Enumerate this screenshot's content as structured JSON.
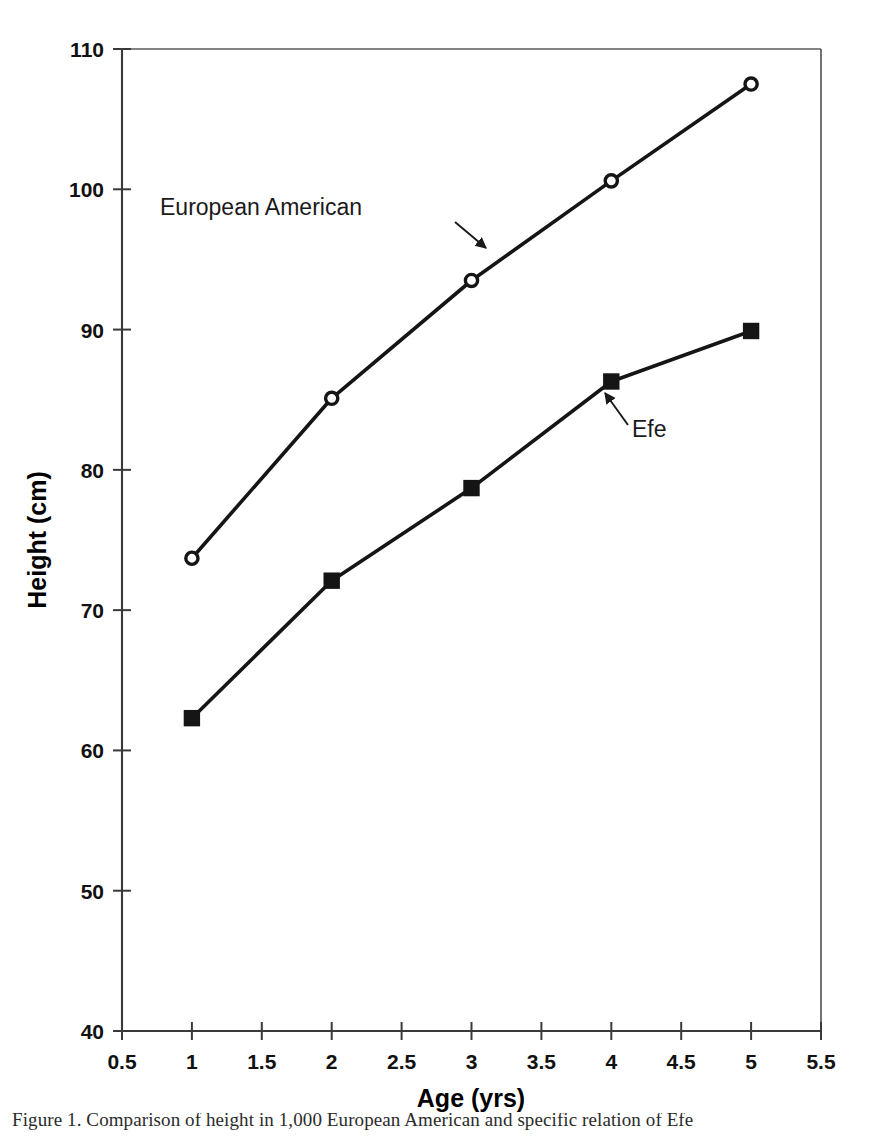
{
  "chart_data": {
    "type": "line",
    "title": "",
    "xlabel": "Age (yrs)",
    "ylabel": "Height (cm)",
    "xlim": [
      0.5,
      5.5
    ],
    "ylim": [
      40,
      110
    ],
    "xticks": [
      "0.5",
      "1",
      "1.5",
      "2",
      "2.5",
      "3",
      "3.5",
      "4",
      "4.5",
      "5",
      "5.5"
    ],
    "xtick_values": [
      0.5,
      1,
      1.5,
      2,
      2.5,
      3,
      3.5,
      4,
      4.5,
      5,
      5.5
    ],
    "yticks": [
      "110",
      "100",
      "90",
      "80",
      "70",
      "60",
      "50",
      "40"
    ],
    "ytick_values": [
      110,
      100,
      90,
      80,
      70,
      60,
      50,
      40
    ],
    "grid": false,
    "legend": "annotations-inline",
    "x": [
      1,
      2,
      3,
      4,
      5
    ],
    "series": [
      {
        "name": "European American",
        "marker": "open-circle",
        "values": [
          73.7,
          85.1,
          93.5,
          100.6,
          107.5
        ]
      },
      {
        "name": "Efe",
        "marker": "filled-square",
        "values": [
          62.3,
          72.1,
          78.7,
          86.3,
          89.9
        ]
      }
    ],
    "annotations": [
      {
        "label": "European American",
        "text_x": 160,
        "text_y": 215,
        "arrow_from_x": 455,
        "arrow_from_y": 222,
        "arrow_to_x": 486,
        "arrow_to_y": 248
      },
      {
        "label": "Efe",
        "text_x": 632,
        "text_y": 437,
        "arrow_from_x": 628,
        "arrow_from_y": 425,
        "arrow_to_x": 605,
        "arrow_to_y": 393
      }
    ]
  },
  "caption": {
    "text": "Figure 1.  Comparison of height in 1,000 European American and specific relation of Efe"
  },
  "colors": {
    "line": "#151515",
    "axis": "#3a3a3a",
    "text": "#000000",
    "background": "#ffffff"
  }
}
